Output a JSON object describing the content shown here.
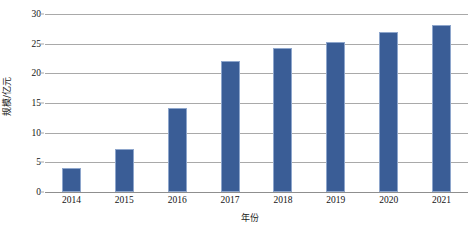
{
  "chart_data": {
    "type": "bar",
    "title": "",
    "xlabel": "年份",
    "ylabel": "规模/亿元",
    "categories": [
      "2014",
      "2015",
      "2016",
      "2017",
      "2018",
      "2019",
      "2020",
      "2021"
    ],
    "values": [
      4.0,
      7.2,
      14.2,
      22.0,
      24.2,
      25.2,
      27.0,
      28.2
    ],
    "series": [
      {
        "name": "规模",
        "values": [
          4.0,
          7.2,
          14.2,
          22.0,
          24.2,
          25.2,
          27.0,
          28.2
        ]
      }
    ],
    "ylim": [
      0,
      30
    ],
    "yticks": [
      0,
      5,
      10,
      15,
      20,
      25,
      30
    ],
    "ytick_labels": [
      "0",
      "5",
      "10",
      "15",
      "20",
      "25",
      "30"
    ],
    "grid": true,
    "grid_axis": "y",
    "legend": false,
    "legend_position": "none",
    "bar_color": "#3a5d96",
    "bar_edge_color": "#8ea6cc",
    "gridline_color": "#a9a9a9",
    "axis_color": "#8f8f8f",
    "background": "#ffffff"
  }
}
